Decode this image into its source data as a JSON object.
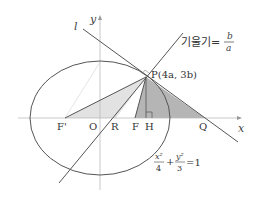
{
  "diagram": {
    "axes": {
      "x_label": "x",
      "y_label": "y"
    },
    "points": {
      "F_prime": "F'",
      "O": "O",
      "R": "R",
      "F": "F",
      "H": "H",
      "Q": "Q",
      "P": "P(4a, 3b)"
    },
    "line_label": "l",
    "slope_annotation": {
      "text": "기울기=",
      "numerator": "b",
      "denominator": "a"
    },
    "equation": {
      "x_term_num": "x²",
      "x_term_den": "4",
      "plus": "+",
      "y_term_num": "y²",
      "y_term_den": "3",
      "rhs": "=1"
    },
    "colors": {
      "line": "#555555",
      "axis": "#bbbbbb",
      "shade_light": "#e2e2e2",
      "shade_dark": "#b5b5b5",
      "faint_line": "#dddddd"
    }
  }
}
